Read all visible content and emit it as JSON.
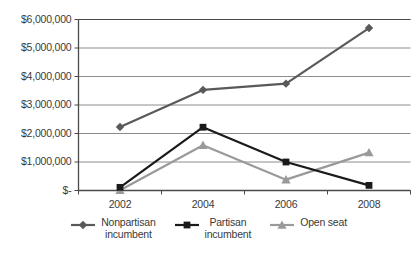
{
  "chart_data": {
    "type": "line",
    "title": "",
    "xlabel": "",
    "ylabel": "",
    "categories": [
      "2002",
      "2004",
      "2006",
      "2008"
    ],
    "ylim": [
      0,
      6000000
    ],
    "ytick_values": [
      0,
      1000000,
      2000000,
      3000000,
      4000000,
      5000000,
      6000000
    ],
    "ytick_labels": [
      "$-",
      "$1,000,000",
      "$2,000,000",
      "$3,000,000",
      "$4,000,000",
      "$5,000,000",
      "$6,000,000"
    ],
    "grid": true,
    "legend_position": "bottom",
    "series": [
      {
        "name": "Nonpartisan incumbent",
        "legend_label": "Nonpartisan\nincumbent",
        "marker": "diamond",
        "color": "#595959",
        "values": [
          2230000,
          3530000,
          3750000,
          5700000
        ]
      },
      {
        "name": "Partisan incumbent",
        "legend_label": "Partisan\nincumbent",
        "marker": "square",
        "color": "#1a1a1a",
        "values": [
          110000,
          2220000,
          1000000,
          180000
        ]
      },
      {
        "name": "Open seat",
        "legend_label": "Open seat",
        "marker": "triangle",
        "color": "#9a9a9a",
        "values": [
          10000,
          1590000,
          380000,
          1330000
        ]
      }
    ]
  },
  "axis": {
    "axis_color": "#4a4a4a",
    "grid_color": "#8c8c8c"
  }
}
